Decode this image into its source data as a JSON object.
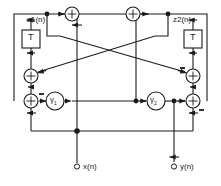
{
  "figure": {
    "kind": "signal-flow-diagram",
    "title": "",
    "width": 221,
    "height": 186,
    "stroke_color": "#1a1a1a",
    "background_color": "#ffffff"
  },
  "labels": {
    "state_left": "z1(n)",
    "state_right": "z2(n)",
    "input": "x(n)",
    "output": "y(n)",
    "delay_left": "T",
    "delay_right": "T",
    "coeff_left": "γ",
    "coeff_left_sub": "1",
    "coeff_right": "γ",
    "coeff_right_sub": "2"
  },
  "nodes": {
    "adders": [
      {
        "name": "adder-top-left",
        "x": 72,
        "y": 14,
        "r": 7,
        "signs": []
      },
      {
        "name": "adder-top-right",
        "x": 133,
        "y": 14,
        "r": 7,
        "signs": []
      },
      {
        "name": "adder-mid-left",
        "x": 31,
        "y": 76,
        "r": 7,
        "signs": []
      },
      {
        "name": "adder-mid-right",
        "x": 192,
        "y": 76,
        "r": 7,
        "signs": [
          "minus-top-left"
        ]
      },
      {
        "name": "adder-low-left",
        "x": 31,
        "y": 101,
        "r": 7,
        "signs": [
          "minus-top-right"
        ]
      },
      {
        "name": "adder-low-right",
        "x": 192,
        "y": 101,
        "r": 7,
        "signs": [
          "minus-bottom-right"
        ]
      }
    ],
    "delays": [
      {
        "name": "delay-left",
        "x": 22,
        "y": 30,
        "w": 18,
        "h": 18
      },
      {
        "name": "delay-right",
        "x": 184,
        "y": 30,
        "w": 18,
        "h": 18
      }
    ],
    "multipliers": [
      {
        "name": "multiplier-gamma-1",
        "x": 55,
        "y": 101,
        "r": 9
      },
      {
        "name": "multiplier-gamma-2",
        "x": 156,
        "y": 101,
        "r": 9
      }
    ],
    "terminals": [
      {
        "name": "terminal-input",
        "x": 77,
        "y": 167,
        "r": 2.5
      },
      {
        "name": "terminal-output",
        "x": 176,
        "y": 167,
        "r": 2.5
      }
    ],
    "junctions": [
      {
        "name": "junction-z1",
        "x": 47,
        "y": 14
      },
      {
        "name": "junction-z2",
        "x": 168,
        "y": 14
      },
      {
        "name": "junction-gamma2-in",
        "x": 136,
        "y": 101
      },
      {
        "name": "junction-gamma2-out",
        "x": 174,
        "y": 101
      },
      {
        "name": "junction-feedback",
        "x": 77,
        "y": 131
      }
    ]
  },
  "legend": {
    "adder_symbol": "⊕",
    "minus_symbol": "−"
  }
}
